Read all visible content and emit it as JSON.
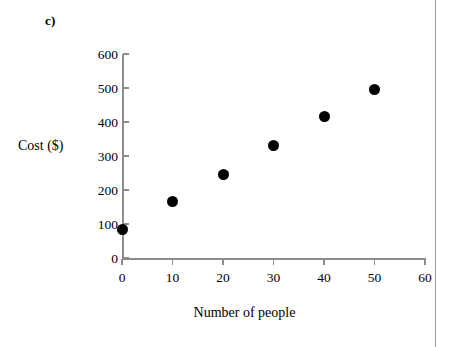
{
  "panel": {
    "letter": "c)"
  },
  "chart_data": {
    "type": "scatter",
    "title": "",
    "subtitle": "",
    "xlabel": "Number of people",
    "ylabel": "Cost ($)",
    "xlim": [
      0,
      60
    ],
    "ylim": [
      0,
      600
    ],
    "xticks": [
      0,
      10,
      20,
      30,
      40,
      50,
      60
    ],
    "yticks": [
      0,
      100,
      200,
      300,
      400,
      500,
      600
    ],
    "xtick_labels": [
      "0",
      "10",
      "20",
      "30",
      "40",
      "50",
      "60"
    ],
    "ytick_labels": [
      "0",
      "100",
      "200",
      "300",
      "400",
      "500",
      "600"
    ],
    "grid": false,
    "legend": null,
    "marker": {
      "shape": "circle",
      "color": "#000000",
      "size": 11
    },
    "series": [
      {
        "name": "Cost vs number of people",
        "x": [
          0,
          10,
          20,
          30,
          40,
          50
        ],
        "y": [
          85,
          165,
          245,
          330,
          415,
          497
        ],
        "points": [
          {
            "x": 0,
            "y": 85
          },
          {
            "x": 10,
            "y": 165
          },
          {
            "x": 20,
            "y": 245
          },
          {
            "x": 30,
            "y": 330
          },
          {
            "x": 40,
            "y": 415
          },
          {
            "x": 50,
            "y": 497
          }
        ]
      }
    ],
    "annotations": []
  },
  "colors": {
    "marker": "#000000",
    "axis": "#8c8c8c",
    "text": "#000000",
    "background": "#ffffff",
    "page_rule": "#9a9a9a"
  }
}
